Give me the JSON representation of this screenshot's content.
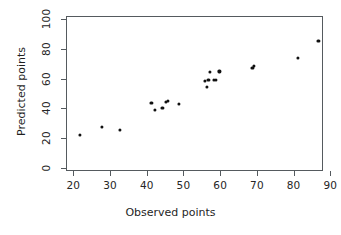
{
  "chart_data": {
    "type": "scatter",
    "title": "",
    "xlabel": "Observed points",
    "ylabel": "Predicted points",
    "xlim": [
      18,
      88
    ],
    "ylim": [
      -2,
      102
    ],
    "xticks": [
      20,
      30,
      40,
      50,
      60,
      70,
      80,
      90
    ],
    "yticks": [
      0,
      20,
      40,
      60,
      80,
      100
    ],
    "grid": false,
    "legend": null,
    "marker": "filled-circle",
    "marker_color": "#111111",
    "axis_color": "#555a5e",
    "background": "#ffffff",
    "points": [
      {
        "x": 21.5,
        "y": 23.0
      },
      {
        "x": 27.5,
        "y": 28.0
      },
      {
        "x": 32.5,
        "y": 26.0
      },
      {
        "x": 41.0,
        "y": 44.5
      },
      {
        "x": 42.0,
        "y": 39.5
      },
      {
        "x": 44.0,
        "y": 41.0
      },
      {
        "x": 45.0,
        "y": 45.0
      },
      {
        "x": 45.5,
        "y": 45.5
      },
      {
        "x": 48.5,
        "y": 43.5
      },
      {
        "x": 55.5,
        "y": 59.0
      },
      {
        "x": 56.0,
        "y": 55.0
      },
      {
        "x": 56.5,
        "y": 60.0
      },
      {
        "x": 57.0,
        "y": 65.0
      },
      {
        "x": 58.0,
        "y": 60.0
      },
      {
        "x": 58.5,
        "y": 60.0
      },
      {
        "x": 59.5,
        "y": 65.5
      },
      {
        "x": 68.5,
        "y": 68.0
      },
      {
        "x": 69.0,
        "y": 69.0
      },
      {
        "x": 81.0,
        "y": 74.5
      },
      {
        "x": 86.5,
        "y": 86.0
      }
    ]
  }
}
